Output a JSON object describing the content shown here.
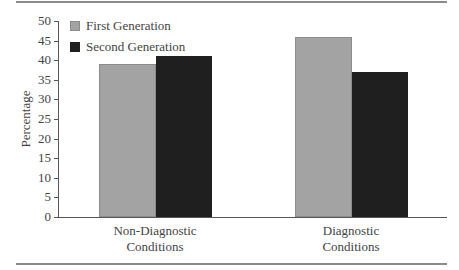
{
  "chart_data": {
    "type": "bar",
    "title": "",
    "xlabel": "",
    "ylabel": "Percentage",
    "ylim": [
      0,
      50
    ],
    "yticks": [
      0,
      5,
      10,
      15,
      20,
      25,
      30,
      35,
      40,
      45,
      50
    ],
    "grid": false,
    "legend_position": "top-left",
    "categories": [
      "Non-Diagnostic Conditions",
      "Diagnostic Conditions"
    ],
    "category_lines": [
      [
        "Non-Diagnostic",
        "Conditions"
      ],
      [
        "Diagnostic",
        "Conditions"
      ]
    ],
    "series": [
      {
        "name": "First Generation",
        "color": "#a3a3a3",
        "values": [
          39,
          46
        ]
      },
      {
        "name": "Second Generation",
        "color": "#1f1f1f",
        "values": [
          41,
          37
        ]
      }
    ]
  }
}
